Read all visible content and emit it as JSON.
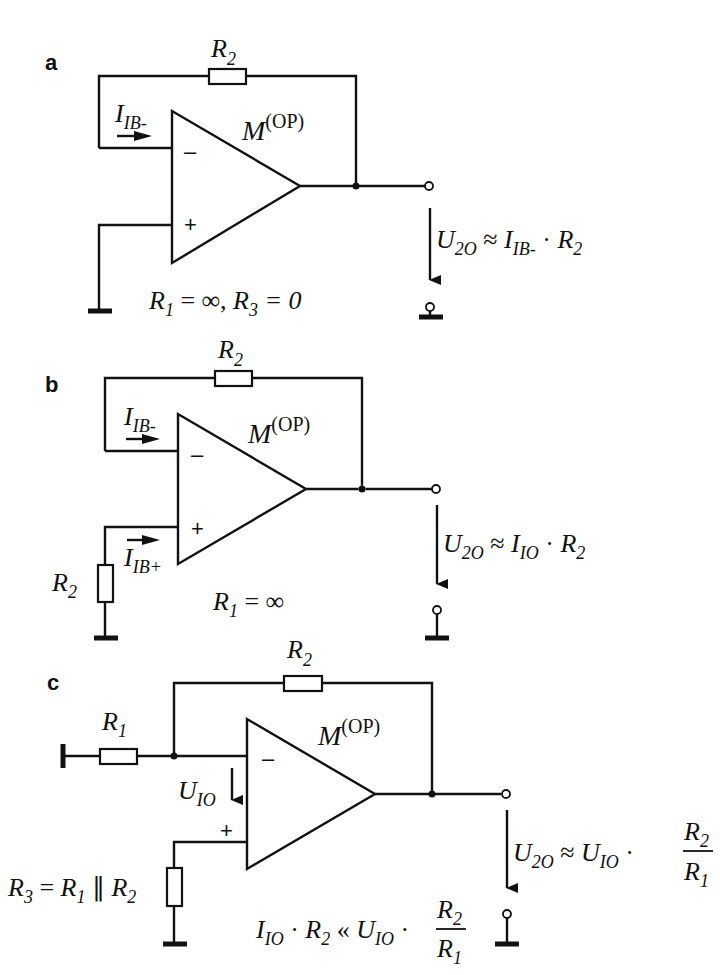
{
  "figure": {
    "panels": [
      {
        "id": "a",
        "label": "a",
        "feedback_resistor": "R",
        "feedback_resistor_sub": "2",
        "opamp_name": "M",
        "opamp_sup": "(OP)",
        "current_label": "I",
        "current_sub": "IB-",
        "minus_sign": "–",
        "plus_sign": "+",
        "condition": "R₁ = ∞, R₃ = 0",
        "condition_parts": {
          "r1": "R",
          "r1_sub": "1",
          "eq1": " = ∞, ",
          "r3": "R",
          "r3_sub": "3",
          "eq2": " = 0"
        },
        "output_voltage": {
          "u": "U",
          "u_sub": "2O",
          "approx": " ≈ ",
          "i": "I",
          "i_sub": "IB-",
          "dot": " · ",
          "r": "R",
          "r_sub": "2"
        }
      },
      {
        "id": "b",
        "label": "b",
        "feedback_resistor": "R",
        "feedback_resistor_sub": "2",
        "input_resistor": "R",
        "input_resistor_sub": "2",
        "opamp_name": "M",
        "opamp_sup": "(OP)",
        "current_minus_label": "I",
        "current_minus_sub": "IB-",
        "current_plus_label": "I",
        "current_plus_sub": "IB+",
        "minus_sign": "–",
        "plus_sign": "+",
        "condition_parts": {
          "r1": "R",
          "r1_sub": "1",
          "eq1": " = ∞"
        },
        "output_voltage": {
          "u": "U",
          "u_sub": "2O",
          "approx": " ≈ ",
          "i": "I",
          "i_sub": "IO",
          "dot": " · ",
          "r": "R",
          "r_sub": "2"
        }
      },
      {
        "id": "c",
        "label": "c",
        "feedback_resistor": "R",
        "feedback_resistor_sub": "2",
        "input_resistor": "R",
        "input_resistor_sub": "1",
        "opamp_name": "M",
        "opamp_sup": "(OP)",
        "offset_voltage": "U",
        "offset_voltage_sub": "IO",
        "minus_sign": "–",
        "plus_sign": "+",
        "r3_label": {
          "r3": "R",
          "r3_sub": "3",
          "eq": " = ",
          "r1": "R",
          "r1_sub": "1",
          "par": " ∥ ",
          "r2": "R",
          "r2_sub": "2"
        },
        "condition": {
          "i": "I",
          "i_sub": "IO",
          "dot": " · ",
          "r": "R",
          "r_sub": "2",
          "ll": " « ",
          "u": "U",
          "u_sub": "IO",
          "dot2": " · ",
          "num": "R",
          "num_sub": "2",
          "den": "R",
          "den_sub": "1"
        },
        "output_voltage": {
          "u": "U",
          "u_sub": "2O",
          "approx": " ≈ ",
          "u2": "U",
          "u2_sub": "IO",
          "dot": " · ",
          "num": "R",
          "num_sub": "2",
          "den": "R",
          "den_sub": "1"
        }
      }
    ]
  }
}
